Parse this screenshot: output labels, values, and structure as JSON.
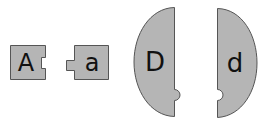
{
  "colors": {
    "piece_fill": "#b5b5b5",
    "piece_stroke": "#555555",
    "letter": "#111111"
  },
  "pieces": [
    {
      "id": "A",
      "label": "A",
      "shape": "square",
      "connector": "notch-right"
    },
    {
      "id": "a",
      "label": "a",
      "shape": "square",
      "connector": "tab-left"
    },
    {
      "id": "D",
      "label": "D",
      "shape": "half-oval-left",
      "connector": "tab-right"
    },
    {
      "id": "d",
      "label": "d",
      "shape": "half-oval-right",
      "connector": "notch-left"
    }
  ]
}
